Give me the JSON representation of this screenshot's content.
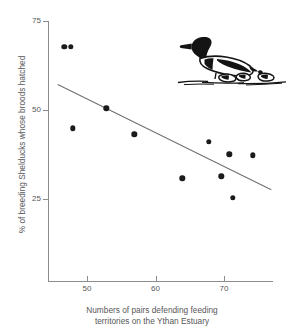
{
  "chart_data": {
    "type": "scatter",
    "title": "",
    "xlabel": "Numbers of pairs defending feeding territories on the Ythan Estuary",
    "ylabel": "% of breeding Shelducks whose broods hatched",
    "xlim": [
      44.5,
      77.2
    ],
    "ylim": [
      18.5,
      75
    ],
    "xticks": [
      50,
      60,
      70
    ],
    "xticklabels": [
      "50",
      "60",
      "70"
    ],
    "yticks": [
      25,
      50,
      75
    ],
    "yticklabels": [
      "25",
      "50",
      "75"
    ],
    "grid": false,
    "legend": null,
    "points": [
      {
        "x": 46.7,
        "y": 67.7
      },
      {
        "x": 47.6,
        "y": 67.7
      },
      {
        "x": 47.9,
        "y": 44.9
      },
      {
        "x": 52.8,
        "y": 50.5
      },
      {
        "x": 56.9,
        "y": 43.2
      },
      {
        "x": 63.9,
        "y": 30.8
      },
      {
        "x": 67.8,
        "y": 41.0
      },
      {
        "x": 69.6,
        "y": 31.4
      },
      {
        "x": 70.8,
        "y": 37.6
      },
      {
        "x": 71.3,
        "y": 25.4
      },
      {
        "x": 74.2,
        "y": 37.3
      }
    ],
    "trend_line": {
      "type": "line",
      "x": [
        45.8,
        76.9
      ],
      "y": [
        57.4,
        27.9
      ]
    },
    "annotations": [
      {
        "name": "shelduck-with-ducklings-illustration",
        "type": "image"
      }
    ]
  },
  "axis_titles": {
    "y": "% of breeding Shelducks whose broods hatched",
    "x_line1": "Numbers of pairs defending feeding",
    "x_line2": "territories on the Ythan Estuary"
  },
  "colors": {
    "point": "#1b1b1b",
    "axis": "#8d8d8d",
    "trend": "#6f6f6f",
    "text": "#57575a",
    "background": "#ffffff"
  }
}
